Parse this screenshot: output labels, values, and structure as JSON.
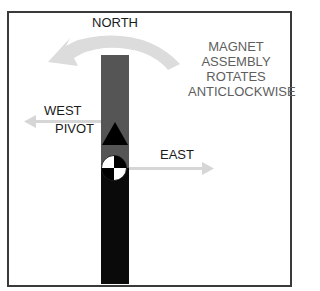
{
  "labels": {
    "north": "NORTH",
    "west": "WEST",
    "pivot": "PIVOT",
    "east": "EAST",
    "rotation_note": [
      "MAGNET",
      "ASSEMBLY",
      "ROTATES",
      "ANTICLOCKWISE"
    ]
  },
  "colors": {
    "frame": "#3a3a3a",
    "bar_upper": "#555555",
    "bar_lower": "#0a0a0a",
    "pivot_triangle": "#000000",
    "arrows": "#d9d9d9",
    "note_text": "#5e5e5e",
    "label_text": "#1a1a1a"
  }
}
